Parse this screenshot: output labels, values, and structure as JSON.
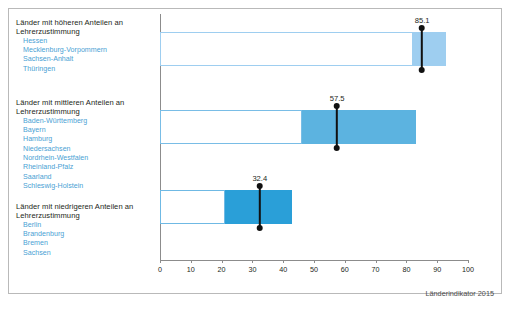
{
  "chart_data": {
    "type": "bar",
    "title": "",
    "subtitle": "",
    "xlabel": "",
    "ylabel": "",
    "xlim": [
      0,
      100
    ],
    "xticks": [
      0,
      10,
      20,
      30,
      40,
      50,
      60,
      70,
      80,
      90,
      100
    ],
    "grid": false,
    "legend": null,
    "orientation": "horizontal",
    "note": "Floating/range bars with a mean marker; each row is a group of Bundesländer.",
    "categories": [
      "Länder mit höheren Anteilen an Lehrerzustimmung",
      "Länder mit mittleren Anteilen an Lehrerzustimmung",
      "Länder mit niedrigeren Anteilen an Lehrerzustimmung"
    ],
    "series": [
      {
        "name": "Bereich (hell/offen)",
        "values": [
          [
            0,
            82
          ],
          [
            0,
            46
          ],
          [
            0,
            21
          ]
        ]
      },
      {
        "name": "Bereich (gefüllt)",
        "values": [
          [
            82,
            93
          ],
          [
            46,
            83
          ],
          [
            21,
            43
          ]
        ]
      },
      {
        "name": "Mittelwert",
        "values": [
          85.1,
          57.5,
          32.4
        ]
      }
    ],
    "markers": [
      85.1,
      57.5,
      32.4
    ],
    "marker_labels": [
      "85.1",
      "57.5",
      "32.4"
    ]
  },
  "groups": [
    {
      "heading": "Länder mit höheren Anteilen an Lehrerzustimmung",
      "heading_line1": "Länder mit höheren Anteilen an",
      "heading_line2": "Lehrerzustimmung",
      "items": [
        "Hessen",
        "Mecklenburg-Vorpommern",
        "Sachsen-Anhalt",
        "Thüringen"
      ],
      "open_start": 0,
      "open_end": 82,
      "fill_start": 82,
      "fill_end": 93,
      "marker": 85.1,
      "marker_label": "85.1",
      "fill_color": "#9ecef0",
      "edge_color": "#9ecef0"
    },
    {
      "heading": "Länder mit mittleren Anteilen an Lehrerzustimmung",
      "heading_line1": "Länder mit mittleren Anteilen an",
      "heading_line2": "Lehrerzustimmung",
      "items": [
        "Baden-Württemberg",
        "Bayern",
        "Hamburg",
        "Niedersachsen",
        "Nordrhein-Westfalen",
        "Rheinland-Pfalz",
        "Saarland",
        "Schleswig-Holstein"
      ],
      "open_start": 0,
      "open_end": 46,
      "fill_start": 46,
      "fill_end": 83,
      "marker": 57.5,
      "marker_label": "57.5",
      "fill_color": "#5cb3e0",
      "edge_color": "#79bde6"
    },
    {
      "heading": "Länder mit niedrigeren Anteilen an Lehrerzustimmung",
      "heading_line1": "Länder mit niedrigeren Anteilen an",
      "heading_line2": "Lehrerzustimmung",
      "items": [
        "Berlin",
        "Brandenburg",
        "Bremen",
        "Sachsen"
      ],
      "open_start": 0,
      "open_end": 21,
      "fill_start": 21,
      "fill_end": 43,
      "marker": 32.4,
      "marker_label": "32.4",
      "fill_color": "#2a9fd8",
      "edge_color": "#6fb9e4"
    }
  ],
  "axis": {
    "ticks": [
      "0",
      "10",
      "20",
      "30",
      "40",
      "50",
      "60",
      "70",
      "80",
      "90",
      "100"
    ]
  },
  "footer": {
    "source": "Länderindikator 2015"
  },
  "colors": {
    "accent_light": "#9ecef0",
    "accent_mid": "#5cb3e0",
    "accent_dark": "#2a9fd8",
    "label_blue": "#4a9fd4",
    "text": "#231f20",
    "axis": "#8c8c8c",
    "frame": "#b9b9b9",
    "marker": "#111111"
  }
}
